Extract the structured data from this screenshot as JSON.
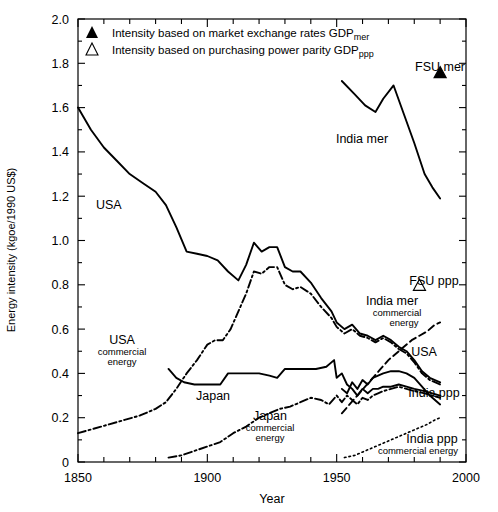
{
  "figure": {
    "axis_title_x": "Year",
    "axis_title_y": "Energy intensity (kgoe/1990 US$)"
  },
  "legend": {
    "items": [
      {
        "marker": "filled-triangle-icon",
        "glyph": "▲",
        "text_main": "Intensity based on market exchange rates GDP",
        "text_sub": "mer"
      },
      {
        "marker": "open-triangle-icon",
        "glyph": "△",
        "text_main": "Intensity based on purchasing power parity GDP",
        "text_sub": "ppp"
      }
    ]
  },
  "annotations": {
    "usa": "USA",
    "usa_commercial_l1": "USA",
    "usa_commercial_l2": "commercial",
    "usa_commercial_l3": "energy",
    "japan": "Japan",
    "japan_commercial_l1": "Japan",
    "japan_commercial_l2": "commercial",
    "japan_commercial_l3": "energy",
    "india_mer": "India mer",
    "india_mer_comm_l1": "India mer",
    "india_mer_comm_l2": "commercial",
    "india_mer_comm_l3": "energy",
    "india_ppp": "India ppp",
    "india_ppp_comm_l1": "India ppp",
    "india_ppp_comm_l2": "commercial energy",
    "usa_right": "USA",
    "fsu_mer": "FSU mer",
    "fsu_ppp": "FSU ppp"
  },
  "chart_data": {
    "type": "line",
    "title": "",
    "xlabel": "Year",
    "ylabel": "Energy intensity (kgoe/1990 US$)",
    "xlim": [
      1850,
      2000
    ],
    "ylim": [
      0,
      2.0
    ],
    "xticks": [
      1850,
      1900,
      1950,
      2000
    ],
    "xtick_labels": [
      "1850",
      "1900",
      "1950",
      "2000"
    ],
    "xminor_step": 10,
    "yticks": [
      0,
      0.2,
      0.4,
      0.6,
      0.8,
      1.0,
      1.2,
      1.4,
      1.6,
      1.8,
      2.0
    ],
    "ytick_labels": [
      "0",
      "0.2",
      "0.4",
      "0.6",
      "0.8",
      "1.0",
      "1.2",
      "1.4",
      "1.6",
      "1.8",
      "2.0"
    ],
    "yminor_step": 0.1,
    "grid": false,
    "legend_position": "top-left-inside",
    "series": [
      {
        "name": "USA",
        "style": "solid",
        "points": [
          [
            1850,
            1.6
          ],
          [
            1855,
            1.5
          ],
          [
            1860,
            1.42
          ],
          [
            1865,
            1.36
          ],
          [
            1870,
            1.3
          ],
          [
            1875,
            1.26
          ],
          [
            1880,
            1.22
          ],
          [
            1884,
            1.16
          ],
          [
            1888,
            1.06
          ],
          [
            1892,
            0.95
          ],
          [
            1896,
            0.94
          ],
          [
            1900,
            0.93
          ],
          [
            1904,
            0.91
          ],
          [
            1908,
            0.86
          ],
          [
            1912,
            0.82
          ],
          [
            1915,
            0.89
          ],
          [
            1918,
            0.99
          ],
          [
            1921,
            0.95
          ],
          [
            1924,
            0.97
          ],
          [
            1927,
            0.97
          ],
          [
            1930,
            0.88
          ],
          [
            1933,
            0.86
          ],
          [
            1936,
            0.86
          ],
          [
            1940,
            0.81
          ],
          [
            1944,
            0.74
          ],
          [
            1948,
            0.68
          ],
          [
            1950,
            0.63
          ],
          [
            1953,
            0.6
          ],
          [
            1956,
            0.62
          ],
          [
            1959,
            0.58
          ],
          [
            1962,
            0.57
          ],
          [
            1965,
            0.55
          ],
          [
            1968,
            0.57
          ],
          [
            1971,
            0.55
          ],
          [
            1974,
            0.52
          ],
          [
            1977,
            0.5
          ],
          [
            1980,
            0.46
          ],
          [
            1983,
            0.41
          ],
          [
            1986,
            0.38
          ],
          [
            1990,
            0.36
          ]
        ]
      },
      {
        "name": "USA commercial energy",
        "style": "dashdot",
        "points": [
          [
            1850,
            0.13
          ],
          [
            1856,
            0.15
          ],
          [
            1862,
            0.17
          ],
          [
            1868,
            0.19
          ],
          [
            1874,
            0.21
          ],
          [
            1880,
            0.24
          ],
          [
            1884,
            0.27
          ],
          [
            1888,
            0.33
          ],
          [
            1892,
            0.4
          ],
          [
            1896,
            0.46
          ],
          [
            1900,
            0.53
          ],
          [
            1903,
            0.55
          ],
          [
            1906,
            0.55
          ],
          [
            1909,
            0.6
          ],
          [
            1912,
            0.68
          ],
          [
            1915,
            0.76
          ],
          [
            1918,
            0.86
          ],
          [
            1921,
            0.85
          ],
          [
            1924,
            0.88
          ],
          [
            1927,
            0.88
          ],
          [
            1930,
            0.8
          ],
          [
            1933,
            0.78
          ],
          [
            1936,
            0.79
          ],
          [
            1940,
            0.76
          ],
          [
            1944,
            0.7
          ],
          [
            1948,
            0.65
          ],
          [
            1950,
            0.61
          ],
          [
            1953,
            0.58
          ],
          [
            1956,
            0.6
          ],
          [
            1959,
            0.57
          ],
          [
            1962,
            0.56
          ],
          [
            1965,
            0.54
          ],
          [
            1968,
            0.56
          ],
          [
            1971,
            0.54
          ],
          [
            1974,
            0.51
          ],
          [
            1977,
            0.49
          ],
          [
            1980,
            0.45
          ],
          [
            1983,
            0.4
          ],
          [
            1986,
            0.37
          ],
          [
            1990,
            0.35
          ]
        ]
      },
      {
        "name": "Japan",
        "style": "solid",
        "points": [
          [
            1885,
            0.42
          ],
          [
            1888,
            0.38
          ],
          [
            1891,
            0.36
          ],
          [
            1895,
            0.35
          ],
          [
            1900,
            0.35
          ],
          [
            1905,
            0.35
          ],
          [
            1908,
            0.4
          ],
          [
            1912,
            0.4
          ],
          [
            1916,
            0.4
          ],
          [
            1920,
            0.4
          ],
          [
            1924,
            0.39
          ],
          [
            1927,
            0.38
          ],
          [
            1930,
            0.42
          ],
          [
            1934,
            0.42
          ],
          [
            1938,
            0.42
          ],
          [
            1942,
            0.42
          ],
          [
            1946,
            0.43
          ],
          [
            1949,
            0.46
          ],
          [
            1950,
            0.38
          ],
          [
            1952,
            0.4
          ],
          [
            1954,
            0.35
          ],
          [
            1956,
            0.33
          ],
          [
            1958,
            0.3
          ],
          [
            1960,
            0.33
          ],
          [
            1962,
            0.31
          ],
          [
            1964,
            0.33
          ],
          [
            1966,
            0.33
          ],
          [
            1968,
            0.34
          ],
          [
            1971,
            0.34
          ],
          [
            1974,
            0.35
          ],
          [
            1977,
            0.34
          ],
          [
            1980,
            0.33
          ],
          [
            1984,
            0.32
          ],
          [
            1987,
            0.31
          ],
          [
            1990,
            0.3
          ]
        ]
      },
      {
        "name": "Japan commercial energy",
        "style": "dashdot",
        "points": [
          [
            1885,
            0.02
          ],
          [
            1890,
            0.03
          ],
          [
            1895,
            0.05
          ],
          [
            1900,
            0.07
          ],
          [
            1905,
            0.09
          ],
          [
            1910,
            0.13
          ],
          [
            1915,
            0.16
          ],
          [
            1920,
            0.2
          ],
          [
            1924,
            0.22
          ],
          [
            1928,
            0.24
          ],
          [
            1932,
            0.25
          ],
          [
            1936,
            0.27
          ],
          [
            1940,
            0.29
          ],
          [
            1944,
            0.28
          ],
          [
            1947,
            0.26
          ],
          [
            1950,
            0.3
          ],
          [
            1952,
            0.27
          ],
          [
            1954,
            0.3
          ],
          [
            1956,
            0.28
          ],
          [
            1958,
            0.26
          ],
          [
            1960,
            0.29
          ],
          [
            1962,
            0.28
          ],
          [
            1964,
            0.3
          ],
          [
            1966,
            0.31
          ],
          [
            1968,
            0.32
          ],
          [
            1971,
            0.33
          ],
          [
            1974,
            0.34
          ],
          [
            1977,
            0.33
          ],
          [
            1980,
            0.32
          ],
          [
            1984,
            0.31
          ],
          [
            1987,
            0.3
          ],
          [
            1990,
            0.29
          ]
        ]
      },
      {
        "name": "India mer",
        "style": "solid",
        "points": [
          [
            1952,
            1.72
          ],
          [
            1957,
            1.66
          ],
          [
            1961,
            1.61
          ],
          [
            1965,
            1.58
          ],
          [
            1968,
            1.64
          ],
          [
            1972,
            1.7
          ],
          [
            1976,
            1.57
          ],
          [
            1980,
            1.44
          ],
          [
            1984,
            1.3
          ],
          [
            1987,
            1.24
          ],
          [
            1990,
            1.19
          ]
        ]
      },
      {
        "name": "India mer commercial energy",
        "style": "dashed",
        "points": [
          [
            1952,
            0.22
          ],
          [
            1955,
            0.26
          ],
          [
            1958,
            0.3
          ],
          [
            1961,
            0.34
          ],
          [
            1964,
            0.38
          ],
          [
            1967,
            0.42
          ],
          [
            1970,
            0.46
          ],
          [
            1973,
            0.49
          ],
          [
            1976,
            0.52
          ],
          [
            1979,
            0.55
          ],
          [
            1982,
            0.57
          ],
          [
            1985,
            0.59
          ],
          [
            1988,
            0.62
          ],
          [
            1990,
            0.63
          ]
        ]
      },
      {
        "name": "India ppp",
        "style": "solid",
        "points": [
          [
            1952,
            0.33
          ],
          [
            1954,
            0.31
          ],
          [
            1956,
            0.36
          ],
          [
            1958,
            0.33
          ],
          [
            1960,
            0.37
          ],
          [
            1962,
            0.35
          ],
          [
            1964,
            0.38
          ],
          [
            1966,
            0.39
          ],
          [
            1968,
            0.4
          ],
          [
            1971,
            0.41
          ],
          [
            1974,
            0.41
          ],
          [
            1977,
            0.4
          ],
          [
            1980,
            0.38
          ],
          [
            1983,
            0.34
          ],
          [
            1986,
            0.3
          ],
          [
            1990,
            0.26
          ]
        ]
      },
      {
        "name": "India ppp commercial energy",
        "style": "dotted",
        "points": [
          [
            1953,
            0.02
          ],
          [
            1957,
            0.03
          ],
          [
            1961,
            0.05
          ],
          [
            1965,
            0.07
          ],
          [
            1969,
            0.09
          ],
          [
            1973,
            0.11
          ],
          [
            1977,
            0.13
          ],
          [
            1981,
            0.15
          ],
          [
            1985,
            0.17
          ],
          [
            1988,
            0.19
          ],
          [
            1990,
            0.2
          ]
        ]
      }
    ],
    "markers": [
      {
        "name": "FSU mer",
        "glyph": "▲",
        "type": "filled-triangle",
        "x": 1990,
        "y": 1.76
      },
      {
        "name": "FSU ppp",
        "glyph": "△",
        "type": "open-triangle",
        "x": 1982,
        "y": 0.8
      }
    ]
  }
}
